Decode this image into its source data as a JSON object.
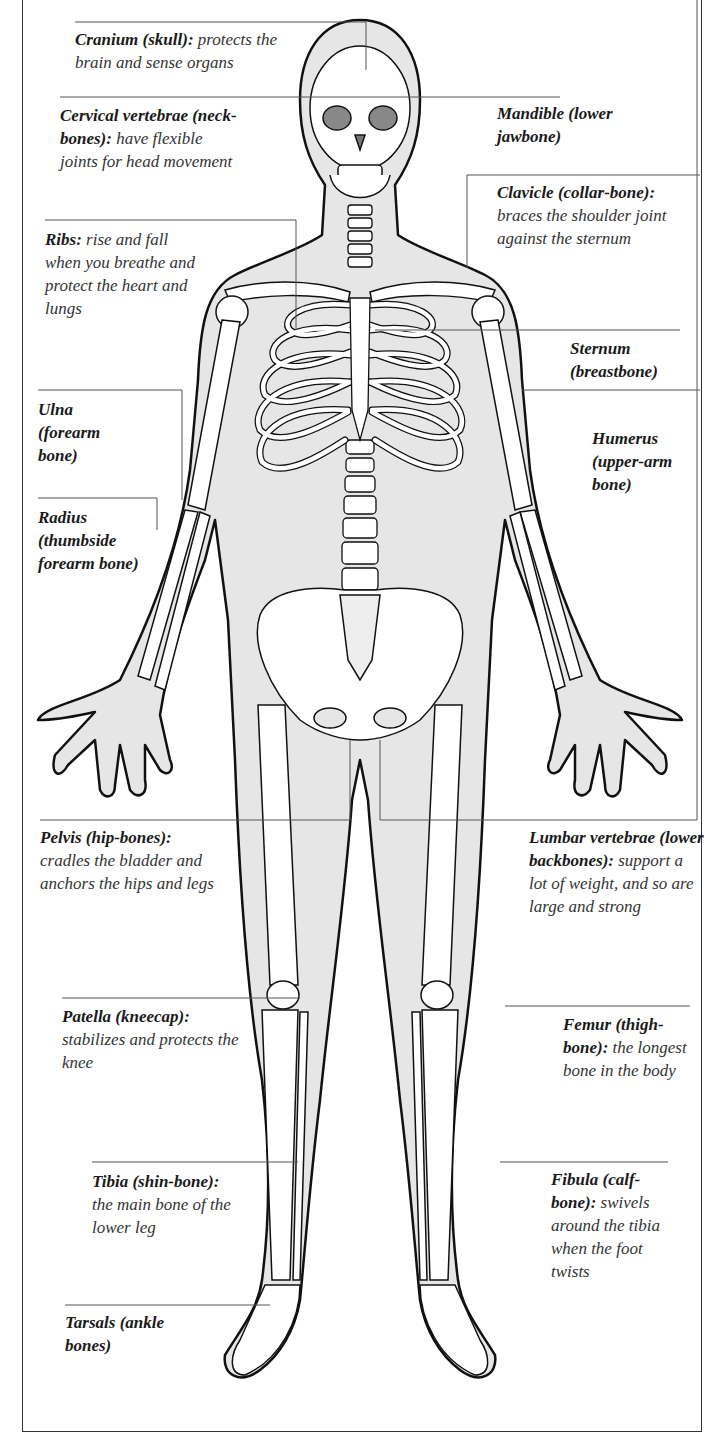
{
  "figure": {
    "colors": {
      "body_fill": "#e6e6e6",
      "bone_fill": "#ffffff",
      "outline": "#111111",
      "leader_line": "#555555",
      "frame": "#333333"
    }
  },
  "labels": {
    "cranium": {
      "term": "Cranium (skull):",
      "desc": "protects the brain and sense organs"
    },
    "cervical": {
      "term": "Cervical vertebrae (neck-bones):",
      "desc": "have flexible joints for head movement"
    },
    "ribs": {
      "term": "Ribs:",
      "desc": "rise and fall when you breathe and protect the heart and lungs"
    },
    "ulna": {
      "term": "Ulna (forearm bone)",
      "desc": ""
    },
    "radius": {
      "term": "Radius (thumbside forearm bone)",
      "desc": ""
    },
    "mandible": {
      "term": "Mandible (lower jawbone)",
      "desc": ""
    },
    "clavicle": {
      "term": "Clavicle (collar-bone):",
      "desc": "braces the shoulder joint against the sternum"
    },
    "sternum": {
      "term": "Sternum (breastbone)",
      "desc": ""
    },
    "humerus": {
      "term": "Humerus (upper-arm bone)",
      "desc": ""
    },
    "pelvis": {
      "term": "Pelvis (hip-bones):",
      "desc": "cradles the bladder and anchors the hips and legs"
    },
    "lumbar": {
      "term": "Lumbar vertebrae (lower backbones):",
      "desc": "support a lot of weight, and so are large and strong"
    },
    "patella": {
      "term": "Patella (kneecap):",
      "desc": "stabilizes and protects the knee"
    },
    "femur": {
      "term": "Femur (thigh-bone):",
      "desc": "the longest bone in the body"
    },
    "tibia": {
      "term": "Tibia (shin-bone):",
      "desc": "the main bone of the lower leg"
    },
    "fibula": {
      "term": "Fibula (calf-bone):",
      "desc": "swivels around the tibia when the foot twists"
    },
    "tarsals": {
      "term": "Tarsals (ankle bones)",
      "desc": ""
    }
  }
}
